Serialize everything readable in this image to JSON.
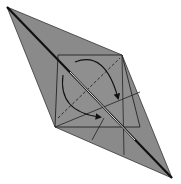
{
  "diagram": {
    "type": "origami-step",
    "colors": {
      "background": "#ffffff",
      "paper": "#8a8a8a",
      "paper_light": "#9a9a9a",
      "line": "#222222",
      "highlight": "#e8e8e8",
      "arrow": "#111111"
    },
    "outline": [
      [
        7,
        7
      ],
      [
        122,
        55
      ],
      [
        172,
        178
      ],
      [
        55,
        127
      ]
    ],
    "square": [
      [
        58,
        55
      ],
      [
        122,
        55
      ],
      [
        140,
        127
      ],
      [
        55,
        127
      ]
    ],
    "creases": {
      "valley_dashed": [
        [
          58,
          118
        ],
        [
          120,
          58
        ]
      ],
      "solid": [
        [
          [
            55,
            127
          ],
          [
            140,
            92
          ]
        ],
        [
          [
            92,
            140
          ],
          [
            104,
            118
          ]
        ],
        [
          [
            122,
            55
          ],
          [
            124,
            155
          ]
        ]
      ]
    },
    "folds": {
      "center_slit": [
        [
          7,
          7
        ],
        [
          172,
          178
        ]
      ]
    },
    "arrows": [
      {
        "name": "upper-rotation-arrow",
        "path": "M75 62 Q105 50 118 98"
      },
      {
        "name": "lower-rotation-arrow",
        "path": "M63 75 Q58 112 100 117"
      }
    ]
  }
}
